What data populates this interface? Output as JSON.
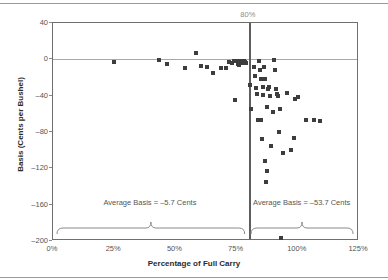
{
  "chart_data": {
    "type": "scatter",
    "title": "",
    "xlabel": "Percentage of Full Carry",
    "ylabel": "Basis (Cents per Bushel)",
    "xlim": [
      0,
      125
    ],
    "ylim": [
      -200,
      40
    ],
    "xticks": [
      "0%",
      "25%",
      "50%",
      "75%",
      "100%",
      "125%"
    ],
    "xtick_values": [
      0,
      25,
      50,
      75,
      100,
      125
    ],
    "yticks": [
      "40",
      "0",
      "-40",
      "-80",
      "-120",
      "-160",
      "-200"
    ],
    "ytick_values": [
      40,
      0,
      -40,
      -80,
      -120,
      -160,
      -200
    ],
    "grid": false,
    "legend": "none",
    "reference_lines": [
      {
        "name": "zero-basis-line",
        "axis": "y",
        "value": 0,
        "color": "#a8a8a8"
      },
      {
        "name": "full-carry-divider",
        "axis": "x",
        "value": 80,
        "label": "80%",
        "color": "#5e5e5e"
      }
    ],
    "annotations": [
      {
        "name": "left-average-annotation",
        "text": "Average Basis = –5.7 Cents",
        "x": 40,
        "y": -158
      },
      {
        "name": "right-average-annotation",
        "text": "Average Basis = –53.7 Cents",
        "x": 102,
        "y": -158
      }
    ],
    "series": [
      {
        "name": "Basis vs Percentage of Full Carry",
        "marker": "square",
        "color": "#3d3d3d",
        "points": [
          [
            25.0,
            -3.0
          ],
          [
            43.5,
            -0.5
          ],
          [
            46.5,
            -5.0
          ],
          [
            54.0,
            -10.0
          ],
          [
            58.5,
            7.0
          ],
          [
            60.5,
            -7.0
          ],
          [
            63.0,
            -8.0
          ],
          [
            65.5,
            -15.0
          ],
          [
            68.5,
            -9.0
          ],
          [
            70.5,
            -10.0
          ],
          [
            72.0,
            -3.0
          ],
          [
            73.2,
            -3.5
          ],
          [
            74.0,
            -2.0
          ],
          [
            74.6,
            -2.0
          ],
          [
            75.2,
            -1.5
          ],
          [
            75.6,
            -5.0
          ],
          [
            76.0,
            -6.0
          ],
          [
            76.4,
            -2.0
          ],
          [
            76.8,
            -3.0
          ],
          [
            77.2,
            -2.5
          ],
          [
            77.8,
            -4.0
          ],
          [
            78.2,
            -2.0
          ],
          [
            78.6,
            -3.0
          ],
          [
            79.0,
            -4.0
          ],
          [
            74.2,
            -45.0
          ],
          [
            80.4,
            -28.0
          ],
          [
            80.8,
            -55.0
          ],
          [
            82.0,
            -8.0
          ],
          [
            82.6,
            -18.0
          ],
          [
            82.8,
            -32.0
          ],
          [
            83.4,
            -38.0
          ],
          [
            83.6,
            -67.0
          ],
          [
            84.2,
            -2.0
          ],
          [
            84.6,
            -12.0
          ],
          [
            84.8,
            -22.0
          ],
          [
            85.0,
            -67.0
          ],
          [
            85.2,
            -88.0
          ],
          [
            85.6,
            -30.0
          ],
          [
            85.8,
            -39.0
          ],
          [
            86.2,
            -8.0
          ],
          [
            86.4,
            -22.0
          ],
          [
            86.8,
            -112.0
          ],
          [
            87.0,
            -135.0
          ],
          [
            87.4,
            -123.0
          ],
          [
            87.6,
            -52.0
          ],
          [
            88.0,
            -33.0
          ],
          [
            88.4,
            -30.0
          ],
          [
            88.8,
            -40.0
          ],
          [
            89.2,
            -95.0
          ],
          [
            89.8,
            -58.0
          ],
          [
            90.2,
            -1.0
          ],
          [
            90.6,
            -12.0
          ],
          [
            91.0,
            -33.0
          ],
          [
            91.6,
            -38.0
          ],
          [
            92.0,
            -40.0
          ],
          [
            92.4,
            -80.0
          ],
          [
            92.8,
            -55.0
          ],
          [
            93.2,
            -197.0
          ],
          [
            94.0,
            -103.0
          ],
          [
            95.6,
            -37.0
          ],
          [
            97.4,
            -100.0
          ],
          [
            98.4,
            -87.0
          ],
          [
            99.0,
            -44.0
          ],
          [
            100.2,
            -41.0
          ],
          [
            103.4,
            -67.0
          ],
          [
            106.6,
            -67.0
          ],
          [
            109.0,
            -68.0
          ]
        ]
      }
    ]
  }
}
